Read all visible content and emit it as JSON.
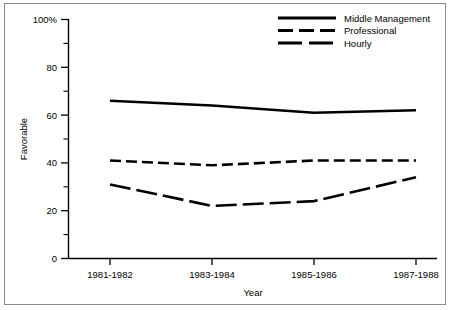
{
  "chart_data": {
    "type": "line",
    "title": "",
    "xlabel": "Year",
    "ylabel": "Favorable",
    "categories": [
      "1981-1982",
      "1983-1984",
      "1985-1986",
      "1987-1988"
    ],
    "ylim": [
      0,
      100
    ],
    "ytick_labels": [
      "0",
      "20",
      "40",
      "60",
      "80",
      "100%"
    ],
    "ytick_values": [
      0,
      20,
      40,
      60,
      80,
      100
    ],
    "yminor_values": [
      10,
      30,
      50,
      70,
      90
    ],
    "grid": false,
    "legend_position": "top-right",
    "series": [
      {
        "name": "Middle Management",
        "style": "solid",
        "values": [
          66,
          64,
          61,
          62
        ]
      },
      {
        "name": "Professional",
        "style": "short-dash",
        "values": [
          41,
          39,
          41,
          41
        ]
      },
      {
        "name": "Hourly",
        "style": "long-dash",
        "values": [
          31,
          22,
          24,
          34
        ]
      }
    ]
  },
  "axes": {
    "y_title": "Favorable",
    "x_title": "Year",
    "y_labels": {
      "t100": "100%",
      "t80": "80",
      "t60": "60",
      "t40": "40",
      "t20": "20",
      "t0": "0"
    },
    "x_labels": {
      "c0": "1981-1982",
      "c1": "1983-1984",
      "c2": "1985-1986",
      "c3": "1987-1988"
    }
  },
  "legend": {
    "entries": [
      {
        "label": "Middle Management"
      },
      {
        "label": "Professional"
      },
      {
        "label": "Hourly"
      }
    ]
  },
  "colors": {
    "ink": "#000000",
    "frame": "#8a8a8a",
    "background": "#ffffff"
  }
}
